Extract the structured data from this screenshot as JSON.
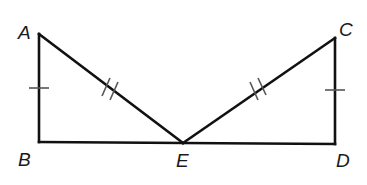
{
  "diagram": {
    "type": "geometry",
    "points": {
      "A": {
        "label": "A",
        "x": 39,
        "y": 34,
        "lx": 18,
        "ly": 39
      },
      "B": {
        "label": "B",
        "x": 39,
        "y": 142,
        "lx": 18,
        "ly": 166
      },
      "E": {
        "label": "E",
        "x": 183,
        "y": 143,
        "lx": 176,
        "ly": 167
      },
      "C": {
        "label": "C",
        "x": 335,
        "y": 38,
        "lx": 339,
        "ly": 36
      },
      "D": {
        "label": "D",
        "x": 335,
        "y": 144,
        "lx": 336,
        "ly": 167
      }
    },
    "segments": [
      {
        "name": "AB",
        "from": "A",
        "to": "B",
        "marks": 1
      },
      {
        "name": "BE",
        "from": "B",
        "to": "E",
        "marks": 0
      },
      {
        "name": "AE",
        "from": "A",
        "to": "E",
        "marks": 2
      },
      {
        "name": "ED",
        "from": "E",
        "to": "D",
        "marks": 0
      },
      {
        "name": "EC",
        "from": "E",
        "to": "C",
        "marks": 2
      },
      {
        "name": "CD",
        "from": "C",
        "to": "D",
        "marks": 1
      }
    ],
    "congruence": [
      "AB ≅ CD",
      "AE ≅ CE"
    ],
    "colors": {
      "stroke": "#111111",
      "tick": "#555555",
      "background": "#ffffff"
    }
  }
}
